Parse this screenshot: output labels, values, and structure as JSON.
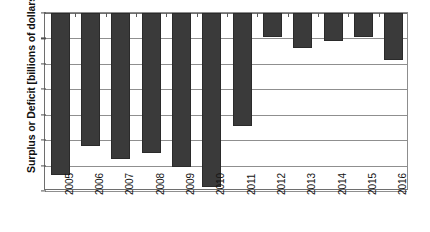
{
  "chart_data": {
    "type": "bar",
    "title": "",
    "xlabel": "",
    "ylabel": "Surplus or Deficit [billions of dollars]",
    "categories": [
      "2005",
      "2006",
      "2007",
      "2008",
      "2009",
      "2010",
      "2011",
      "2012",
      "2013",
      "2014",
      "2015",
      "2016"
    ],
    "values": [
      -318,
      -261,
      -288,
      -275,
      -303,
      -343,
      -223,
      -48,
      -68,
      -55,
      -48,
      -93
    ],
    "ylim": [
      -350,
      0
    ],
    "ytick_labels": [
      "0",
      "-50",
      "-100",
      "-150",
      "-200",
      "-250",
      "-300",
      "-350"
    ],
    "ytick_values": [
      0,
      -50,
      -100,
      -150,
      -200,
      -250,
      -300,
      -350
    ],
    "grid": true,
    "legend": "none",
    "series_name": "Surplus or Deficit",
    "bar_color": "#3a3a3a",
    "grid_color": "#8f8f8f",
    "axis_color": "#6e6e6e",
    "background": "#ffffff"
  }
}
